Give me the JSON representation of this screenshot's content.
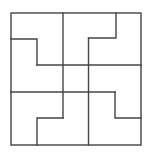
{
  "figure": {
    "piece_count": 4,
    "center_square_count": 1,
    "grid_divisions": 4,
    "colors": {
      "stroke": "#444444",
      "background": "#ffffff"
    },
    "pieces": [
      {
        "name": "piece-top-left",
        "orientation": "top-left"
      },
      {
        "name": "piece-top-right",
        "orientation": "top-right"
      },
      {
        "name": "piece-bottom-right",
        "orientation": "bottom-right"
      },
      {
        "name": "piece-bottom-left",
        "orientation": "bottom-left"
      }
    ]
  }
}
